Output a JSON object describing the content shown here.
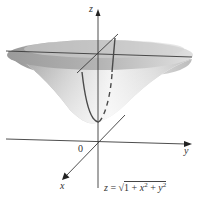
{
  "figure": {
    "type": "3d-surface-diagram",
    "surface": "upper sheet of hyperboloid of two sheets",
    "colors": {
      "background": "#ffffff",
      "surface_light": "#e8e8e8",
      "surface_dark": "#a9a9a9",
      "rim_top": "#c4c4c4",
      "axis": "#3a3a3a",
      "curve": "#4a4a4a"
    }
  },
  "labels": {
    "z_axis": "z",
    "y_axis": "y",
    "x_axis": "x",
    "origin": "0"
  },
  "equation": {
    "lhs": "z",
    "equals": " = ",
    "sqrt": "√",
    "radicand_prefix": "1 + ",
    "x_var": "x",
    "x_exp": "2",
    "plus": " + ",
    "y_var": "y",
    "y_exp": "2"
  }
}
